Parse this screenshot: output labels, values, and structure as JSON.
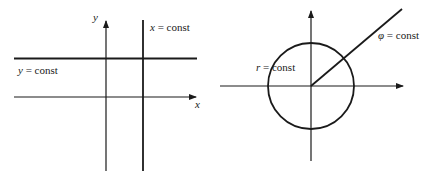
{
  "cartesian": {
    "axis_x_label": "x",
    "axis_y_label": "y",
    "line_x_const": {
      "var": "x",
      "eq": " = const"
    },
    "line_y_const": {
      "var": "y",
      "eq": " = const"
    }
  },
  "polar": {
    "circle_label": {
      "var": "r",
      "eq": " = const"
    },
    "ray_label": {
      "var": "φ",
      "eq": " = const"
    }
  },
  "colors": {
    "line": "#1a1a1a",
    "background": "#ffffff"
  }
}
